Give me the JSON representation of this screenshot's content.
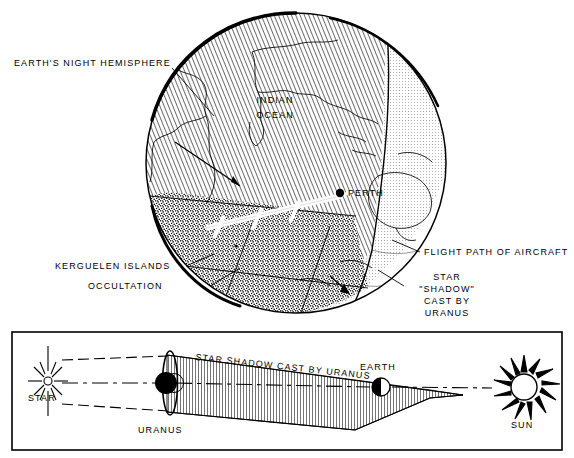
{
  "figure": {
    "ink_color": "#000000",
    "paper_color": "#ffffff"
  },
  "upper_panel": {
    "name": "earth-globe-view",
    "labels": {
      "night_hemisphere": "EARTH'S NIGHT HEMISPHERE",
      "indian_ocean_line1": "INDIAN",
      "indian_ocean_line2": "OCEAN",
      "perth": "PERTH",
      "kerguelen": "KERGUELEN ISLANDS",
      "occultation": "OCCULTATION",
      "flight_path": "FLIGHT PATH OF AIRCRAFT",
      "star_shadow_line1": "STAR",
      "star_shadow_line2": "\"SHADOW\"",
      "star_shadow_line3": "CAST BY",
      "star_shadow_line4": "URANUS"
    }
  },
  "lower_panel": {
    "name": "orbital-geometry-view",
    "labels": {
      "star": "STAR",
      "uranus": "URANUS",
      "shadow_band": "STAR SHADOW CAST BY URANUS",
      "earth": "EARTH",
      "sun": "SUN"
    }
  }
}
